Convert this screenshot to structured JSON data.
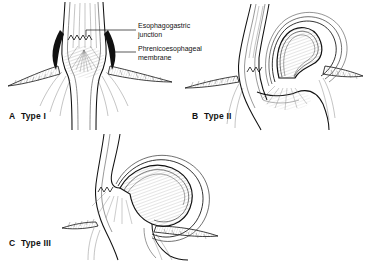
{
  "figure": {
    "style": "pen-and-ink medical line illustration",
    "background_color": "#ffffff",
    "ink_color": "#111111",
    "panel_count": 3
  },
  "labels": {
    "esophagogastric_junction": {
      "line1": "Esophagogastric",
      "line2": "junction",
      "points_to": "z-line at gastroesophageal junction",
      "panel": "A"
    },
    "phrenicoesophageal_membrane": {
      "line1": "Phrenicoesophageal",
      "line2": "membrane",
      "points_to": "membrane between diaphragm and esophagus",
      "panel": "A"
    }
  },
  "panels": [
    {
      "id": "A",
      "letter": "A",
      "caption": "Type I",
      "full_caption": "A  Type I",
      "description": "Sliding hiatal hernia",
      "anatomy": [
        "esophagus",
        "esophagogastric junction",
        "phrenicoesophageal membrane",
        "diaphragm",
        "stomach"
      ]
    },
    {
      "id": "B",
      "letter": "B",
      "caption": "Type II",
      "full_caption": "B  Type II",
      "description": "Paraesophageal hernia",
      "anatomy": [
        "esophagus",
        "herniated gastric fundus",
        "diaphragm",
        "stomach"
      ]
    },
    {
      "id": "C",
      "letter": "C",
      "caption": "Type III",
      "full_caption": "C  Type III",
      "description": "Mixed sliding and paraesophageal hernia",
      "anatomy": [
        "esophagus",
        "esophagogastric junction",
        "herniated fundus",
        "diaphragm",
        "stomach"
      ]
    }
  ]
}
